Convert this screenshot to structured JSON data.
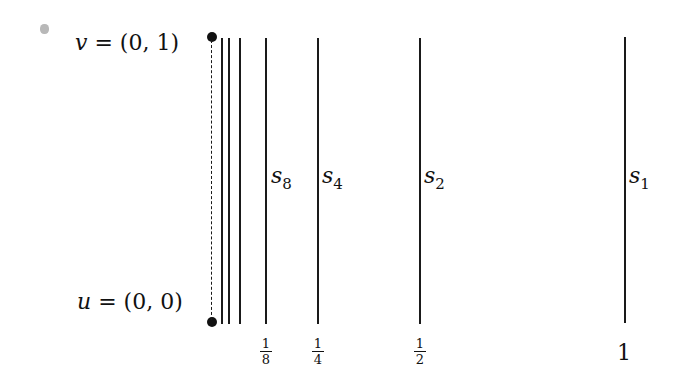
{
  "labels": {
    "v": {
      "var": "v",
      "eq": " = ",
      "val": "(0, 1)"
    },
    "u": {
      "var": "u",
      "eq": " = ",
      "val": "(0, 0)"
    }
  },
  "segments": [
    {
      "name": "s",
      "sub": "8"
    },
    {
      "name": "s",
      "sub": "4"
    },
    {
      "name": "s",
      "sub": "2"
    },
    {
      "name": "s",
      "sub": "1"
    }
  ],
  "ticks": [
    {
      "num": "1",
      "den": "8"
    },
    {
      "num": "1",
      "den": "4"
    },
    {
      "num": "1",
      "den": "2"
    },
    {
      "whole": "1"
    }
  ]
}
